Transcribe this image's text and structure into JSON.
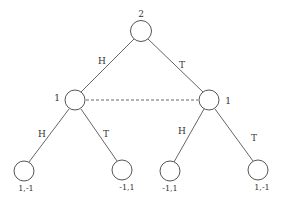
{
  "diagram": {
    "type": "game-tree",
    "nodes": {
      "root": {
        "player": "2"
      },
      "left": {
        "player": "1"
      },
      "right": {
        "player": "1"
      }
    },
    "edges": {
      "root_left": "H",
      "root_right": "T",
      "left_leaf1": "H",
      "left_leaf2": "T",
      "right_leaf3": "H",
      "right_leaf4": "T"
    },
    "leaves": [
      {
        "payoff": "1,-1"
      },
      {
        "payoff": "-1,1"
      },
      {
        "payoff": "-1,1"
      },
      {
        "payoff": "1,-1"
      }
    ],
    "information_set": "dashed line connecting both player-1 nodes"
  }
}
